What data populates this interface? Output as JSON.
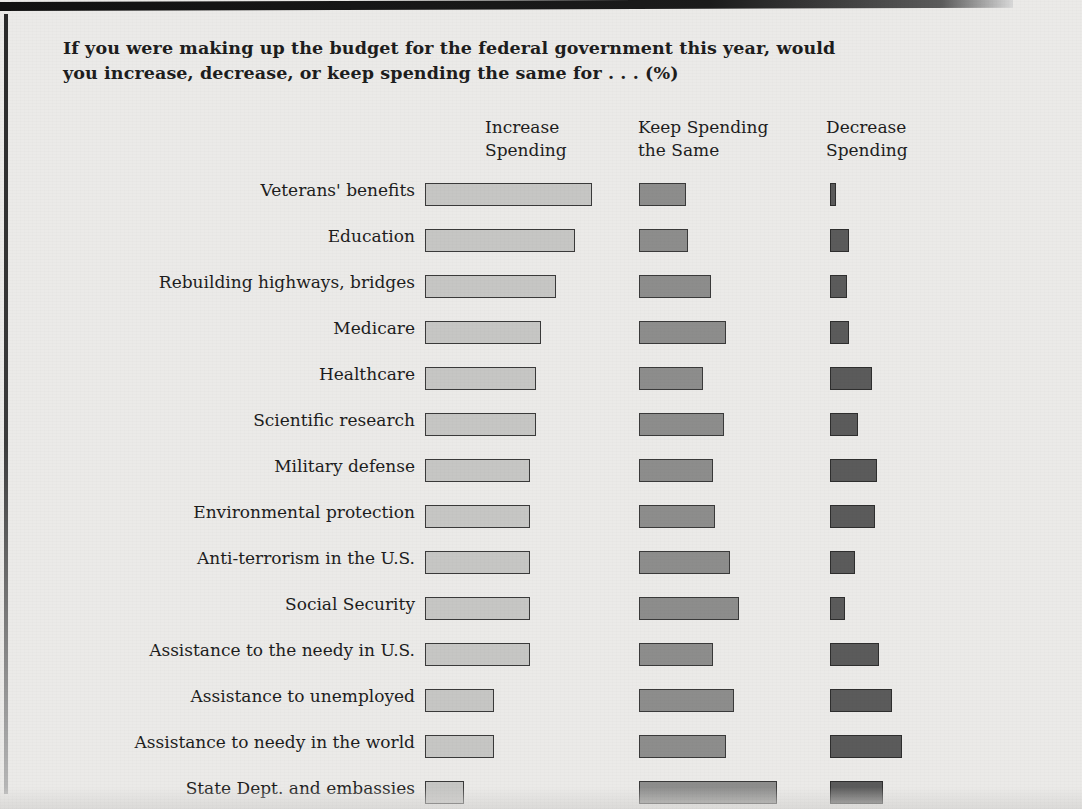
{
  "question": "If you were making up the budget for the federal government this year, would you increase, decrease, or keep spending the same for . . . (%)",
  "headers": {
    "increase": "Increase\nSpending",
    "same": "Keep Spending\nthe Same",
    "decrease": "Decrease\nSpending"
  },
  "colors": {
    "background": "#ebeae8",
    "increase_fill": "#c6c6c4",
    "same_fill": "#8d8d8c",
    "decrease_fill": "#5b5b5b",
    "bar_outline": "#3a3a3a",
    "text": "#1d1d1d"
  },
  "chart_data": {
    "type": "bar",
    "title": "If you were making up the budget for the federal government this year, would you increase, decrease, or keep spending the same for . . . (%)",
    "xlabel": "",
    "ylabel": "",
    "grid": false,
    "legend_position": "column-headers",
    "orientation": "horizontal",
    "layout": "three side-by-side panels, one per response category",
    "note": "Bar lengths are proportional to percent of respondents; no numeric data labels are printed on the figure, values estimated from bar lengths.",
    "xlim": [
      0,
      100
    ],
    "categories": [
      "Veterans' benefits",
      "Education",
      "Rebuilding highways, bridges",
      "Medicare",
      "Healthcare",
      "Scientific research",
      "Military defense",
      "Environmental protection",
      "Anti-terrorism in the U.S.",
      "Social Security",
      "Assistance to the needy in U.S.",
      "Assistance to unemployed",
      "Assistance to needy in the world",
      "State Dept. and embassies"
    ],
    "series": [
      {
        "name": "Increase Spending",
        "color": "#c6c6c4",
        "values": [
          78,
          70,
          61,
          54,
          52,
          52,
          49,
          49,
          49,
          49,
          49,
          32,
          32,
          18
        ]
      },
      {
        "name": "Keep Spending the Same",
        "color": "#8d8d8c",
        "values": [
          22,
          23,
          34,
          41,
          30,
          40,
          35,
          36,
          43,
          47,
          35,
          45,
          41,
          65
        ]
      },
      {
        "name": "Decrease Spending",
        "color": "#5b5b5b",
        "values": [
          3,
          9,
          8,
          9,
          20,
          13,
          22,
          21,
          12,
          7,
          23,
          29,
          34,
          25
        ]
      }
    ]
  }
}
